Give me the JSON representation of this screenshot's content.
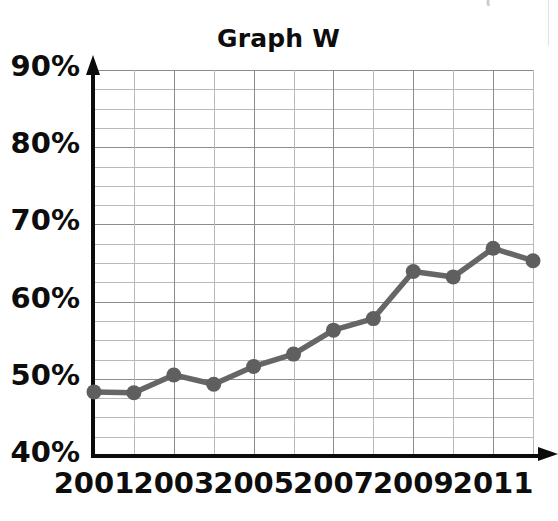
{
  "chart_data": {
    "type": "line",
    "title": "Graph W",
    "xlabel": "",
    "ylabel": "",
    "x": [
      2001,
      2002,
      2003,
      2004,
      2005,
      2006,
      2007,
      2008,
      2009,
      2010,
      2011,
      2012
    ],
    "values": [
      48.3,
      48.2,
      50.5,
      49.3,
      51.6,
      53.2,
      56.3,
      57.8,
      63.9,
      63.2,
      66.9,
      65.3
    ],
    "series": [
      {
        "name": "Graph W",
        "values": [
          48.3,
          48.2,
          50.5,
          49.3,
          51.6,
          53.2,
          56.3,
          57.8,
          63.9,
          63.2,
          66.9,
          65.3
        ]
      }
    ],
    "xlim": [
      2001,
      2012
    ],
    "ylim": [
      40,
      90
    ],
    "grid": true,
    "grid_y_step": 2.5,
    "grid_x_step": 1,
    "legend": "none",
    "marker": "circle",
    "line_color": "#666666",
    "marker_color": "#5f5f5f",
    "grid_color": "#9a9a9a",
    "axis_color": "#0b0b0b",
    "y_tick_labels": [
      "90%",
      "80%",
      "70%",
      "60%",
      "50%",
      "40%"
    ],
    "y_tick_values": [
      90,
      80,
      70,
      60,
      50,
      40
    ],
    "x_tick_labels": [
      "2001",
      "2003",
      "2005",
      "2007",
      "2009",
      "2011"
    ],
    "x_tick_values": [
      2001,
      2003,
      2005,
      2007,
      2009,
      2011
    ],
    "y_axis_unit": "%",
    "annotations": []
  },
  "artifact": {
    "corner_mark": "("
  }
}
